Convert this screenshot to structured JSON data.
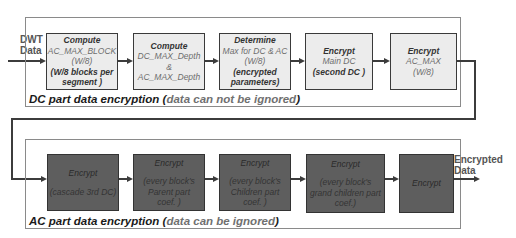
{
  "input": {
    "label_line1": "DWT",
    "label_line2": "Data"
  },
  "output": {
    "label_line1": "Encrypted",
    "label_line2": "Data"
  },
  "dc_group": {
    "caption_main": "DC part data encryption",
    "caption_paren_open": "(",
    "caption_paren_text": "data can not be ignored",
    "caption_paren_close": ")",
    "boxes": [
      {
        "lines": [
          "Compute",
          "AC_MAX_BLOCK",
          "(W/8)",
          "(W/8 blocks per",
          "segment )"
        ]
      },
      {
        "lines": [
          "Compute",
          "DC_MAX_Depth",
          "&",
          "AC_MAX_Depth"
        ]
      },
      {
        "lines": [
          "Determine",
          "Max for DC & AC",
          "(W/8)",
          "(encrypted",
          "parameters)"
        ]
      },
      {
        "lines": [
          "Encrypt",
          "Main DC",
          "(second DC )"
        ]
      },
      {
        "lines": [
          "Encrypt",
          "AC_MAX",
          "(W/8)"
        ]
      }
    ]
  },
  "ac_group": {
    "caption_main": "AC part data encryption",
    "caption_paren_open": "(",
    "caption_paren_text": "data can  be ignored",
    "caption_paren_close": ")",
    "boxes": [
      {
        "lines": [
          "Encrypt",
          "(cascade 3rd DC)"
        ]
      },
      {
        "lines": [
          "Encrypt",
          "(every block's",
          "Parent part",
          "coef. )"
        ]
      },
      {
        "lines": [
          "Encrypt",
          "(every block's",
          "Children part",
          "coef. )"
        ]
      },
      {
        "lines": [
          "Encrypt",
          "(every block's",
          "grand children part",
          "coef.)"
        ]
      },
      {
        "lines": [
          "Encrypt"
        ]
      }
    ]
  },
  "colors": {
    "light_box": "#ececec",
    "dark_box": "#5e5e5e",
    "frame": "#8a8a8a",
    "line": "#3c3c3c"
  }
}
